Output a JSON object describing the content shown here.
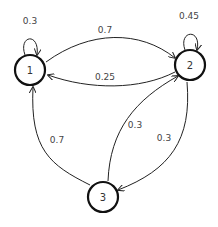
{
  "diagram": {
    "type": "markov-chain",
    "nodes": [
      {
        "id": "1",
        "label": "1"
      },
      {
        "id": "2",
        "label": "2"
      },
      {
        "id": "3",
        "label": "3"
      }
    ],
    "edges": [
      {
        "from": "1",
        "to": "1",
        "label": "0.3"
      },
      {
        "from": "1",
        "to": "2",
        "label": "0.7"
      },
      {
        "from": "2",
        "to": "2",
        "label": "0.45"
      },
      {
        "from": "2",
        "to": "1",
        "label": "0.25"
      },
      {
        "from": "2",
        "to": "3",
        "label": "0.3"
      },
      {
        "from": "3",
        "to": "2",
        "label": "0.3"
      },
      {
        "from": "3",
        "to": "1",
        "label": "0.7"
      }
    ],
    "colors": {
      "stroke": "#222222",
      "text": "#444444",
      "background": "#ffffff"
    }
  }
}
